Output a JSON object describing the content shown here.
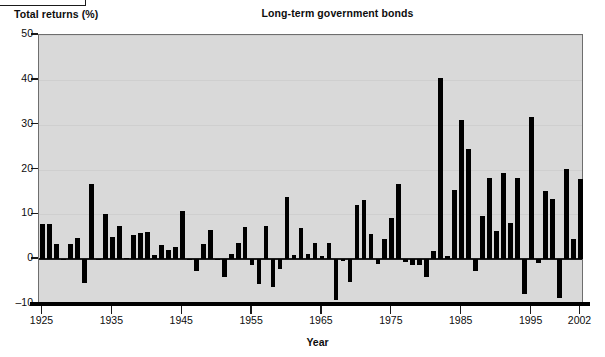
{
  "corner": {
    "label": ""
  },
  "labels": {
    "y_axis_title": "Total returns (%)",
    "chart_title": "Long-term government bonds",
    "x_axis_title": "Year"
  },
  "colors": {
    "bar": "#000000",
    "plot_background": "#d9d9d9",
    "axis": "#1a1a1a",
    "grid": "#cfcfcf",
    "text": "#0d0d0d"
  },
  "chart_data": {
    "type": "bar",
    "title": "Long-term government bonds",
    "xlabel": "Year",
    "ylabel": "Total returns (%)",
    "ylim": [
      -10,
      50
    ],
    "xlim": [
      1925,
      2002
    ],
    "yticks": [
      -10,
      0,
      10,
      20,
      30,
      40,
      50
    ],
    "ytick_labels": [
      "-10",
      "0",
      "10",
      "20",
      "30",
      "40",
      "50"
    ],
    "xticks": [
      1925,
      1935,
      1945,
      1955,
      1965,
      1975,
      1985,
      1995,
      2002
    ],
    "xtick_labels": [
      "1925",
      "1935",
      "1945",
      "1955",
      "1965",
      "1975",
      "1985",
      "1995",
      "2002"
    ],
    "grid": false,
    "legend": "none",
    "categories": [
      1925,
      1926,
      1927,
      1928,
      1929,
      1930,
      1931,
      1932,
      1933,
      1934,
      1935,
      1936,
      1937,
      1938,
      1939,
      1940,
      1941,
      1942,
      1943,
      1944,
      1945,
      1946,
      1947,
      1948,
      1949,
      1950,
      1951,
      1952,
      1953,
      1954,
      1955,
      1956,
      1957,
      1958,
      1959,
      1960,
      1961,
      1962,
      1963,
      1964,
      1965,
      1966,
      1967,
      1968,
      1969,
      1970,
      1971,
      1972,
      1973,
      1974,
      1975,
      1976,
      1977,
      1978,
      1979,
      1980,
      1981,
      1982,
      1983,
      1984,
      1985,
      1986,
      1987,
      1988,
      1989,
      1990,
      1991,
      1992,
      1993,
      1994,
      1995,
      1996,
      1997,
      1998,
      1999,
      2000,
      2001,
      2002
    ],
    "values": [
      7.8,
      7.8,
      3.4,
      0.1,
      3.4,
      4.7,
      -5.3,
      16.8,
      -0.1,
      10.0,
      5.0,
      7.5,
      0.2,
      5.5,
      5.9,
      6.1,
      0.9,
      3.2,
      2.1,
      2.8,
      10.7,
      -0.1,
      -2.6,
      3.4,
      6.5,
      0.1,
      -3.9,
      1.2,
      3.6,
      7.2,
      -1.3,
      -5.6,
      7.5,
      -6.1,
      -2.3,
      13.8,
      1.0,
      6.9,
      1.2,
      3.5,
      0.7,
      3.6,
      -9.2,
      -0.3,
      -5.1,
      12.1,
      13.2,
      5.7,
      -1.1,
      4.4,
      9.2,
      16.8,
      -0.7,
      -1.2,
      -1.2,
      -4.0,
      1.9,
      40.4,
      0.7,
      15.5,
      31.0,
      24.5,
      -2.7,
      9.7,
      18.1,
      6.2,
      19.3,
      8.1,
      18.2,
      -7.8,
      31.7,
      -0.9,
      15.1,
      13.5,
      -8.7,
      20.1,
      4.6,
      17.8
    ]
  }
}
